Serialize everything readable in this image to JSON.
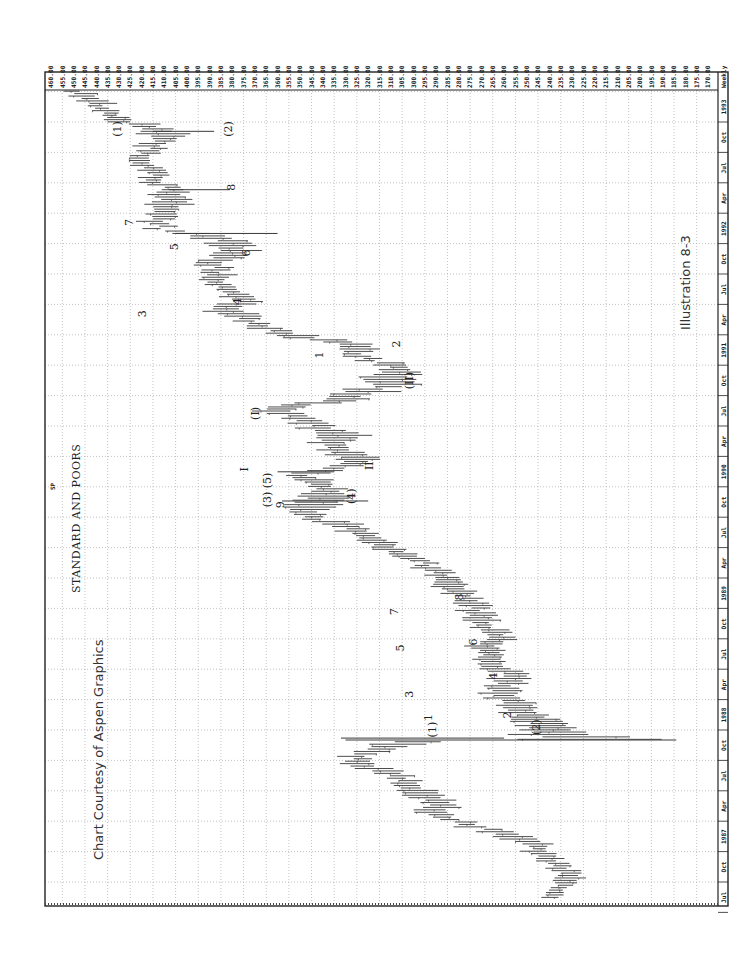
{
  "chart_data": {
    "type": "bar",
    "subtype": "weekly high-low price bars (OHLC range), rotated 90 degrees clockwise",
    "title": "STANDARD AND POORS",
    "symbol": "SP",
    "periodicity": "Weekly",
    "credit": "Chart Courtesy of Aspen Graphics",
    "illustration_label": "Illustration 8-3",
    "orientation": "price axis along top (high values at left), time axis along right side (newest at top)",
    "price_axis": {
      "ticks": [
        "460.00",
        "455.00",
        "450.00",
        "445.00",
        "440.00",
        "435.00",
        "430.00",
        "425.00",
        "420.00",
        "415.00",
        "410.00",
        "405.00",
        "400.00",
        "395.00",
        "390.00",
        "385.00",
        "380.00",
        "375.00",
        "370.00",
        "365.00",
        "360.00",
        "355.00",
        "350.00",
        "345.00",
        "340.00",
        "335.00",
        "330.00",
        "325.00",
        "320.00",
        "315.00",
        "310.00",
        "305.00",
        "300.00",
        "295.00",
        "290.00",
        "285.00",
        "280.00",
        "275.00",
        "270.00",
        "265.00",
        "260.00",
        "255.00",
        "250.00",
        "245.00",
        "240.00",
        "235.00",
        "230.00",
        "225.00",
        "220.00",
        "215.00",
        "210.00",
        "205.00",
        "200.00",
        "195.00",
        "190.00",
        "185.00",
        "180.00",
        "175.00",
        "170.00"
      ],
      "range": [
        170,
        460
      ],
      "grid_every": 10
    },
    "time_axis": {
      "ticks": [
        "Jul",
        "Oct",
        "1987",
        "Apr",
        "Jul",
        "Oct",
        "1988",
        "Apr",
        "Jul",
        "Oct",
        "1989",
        "Apr",
        "Jul",
        "Oct",
        "1990",
        "Apr",
        "Jul",
        "Oct",
        "1991",
        "Apr",
        "Jul",
        "Oct",
        "1992",
        "Apr",
        "Jul",
        "Oct",
        "1993"
      ],
      "range": [
        "1986-07",
        "1993-03"
      ],
      "grid": "quarterly"
    },
    "series": [
      {
        "name": "SP weekly range (approx. midpoint path)",
        "points": [
          {
            "t": 1986.5,
            "low": 236,
            "high": 246
          },
          {
            "t": 1986.6,
            "low": 226,
            "high": 240
          },
          {
            "t": 1986.7,
            "low": 226,
            "high": 240
          },
          {
            "t": 1986.8,
            "low": 232,
            "high": 246
          },
          {
            "t": 1986.92,
            "low": 240,
            "high": 252
          },
          {
            "t": 1987.0,
            "low": 246,
            "high": 266
          },
          {
            "t": 1987.1,
            "low": 270,
            "high": 285
          },
          {
            "t": 1987.2,
            "low": 285,
            "high": 302
          },
          {
            "t": 1987.3,
            "low": 280,
            "high": 300
          },
          {
            "t": 1987.4,
            "low": 290,
            "high": 308
          },
          {
            "t": 1987.5,
            "low": 300,
            "high": 315
          },
          {
            "t": 1987.6,
            "low": 315,
            "high": 335
          },
          {
            "t": 1987.66,
            "low": 318,
            "high": 334
          },
          {
            "t": 1987.74,
            "low": 300,
            "high": 322
          },
          {
            "t": 1987.78,
            "low": 285,
            "high": 315
          },
          {
            "t": 1987.8,
            "low": 185,
            "high": 260
          },
          {
            "t": 1987.86,
            "low": 225,
            "high": 255
          },
          {
            "t": 1987.93,
            "low": 230,
            "high": 255
          },
          {
            "t": 1988.0,
            "low": 240,
            "high": 262
          },
          {
            "t": 1988.08,
            "low": 245,
            "high": 265
          },
          {
            "t": 1988.16,
            "low": 250,
            "high": 270
          },
          {
            "t": 1988.26,
            "low": 250,
            "high": 273
          },
          {
            "t": 1988.34,
            "low": 250,
            "high": 268
          },
          {
            "t": 1988.44,
            "low": 260,
            "high": 275
          },
          {
            "t": 1988.55,
            "low": 260,
            "high": 275
          },
          {
            "t": 1988.62,
            "low": 255,
            "high": 270
          },
          {
            "t": 1988.7,
            "low": 260,
            "high": 273
          },
          {
            "t": 1988.78,
            "low": 265,
            "high": 282
          },
          {
            "t": 1988.88,
            "low": 262,
            "high": 280
          },
          {
            "t": 1989.0,
            "low": 270,
            "high": 285
          },
          {
            "t": 1989.15,
            "low": 280,
            "high": 300
          },
          {
            "t": 1989.25,
            "low": 290,
            "high": 300
          },
          {
            "t": 1989.4,
            "low": 305,
            "high": 322
          },
          {
            "t": 1989.55,
            "low": 320,
            "high": 340
          },
          {
            "t": 1989.65,
            "low": 340,
            "high": 355
          },
          {
            "t": 1989.75,
            "low": 330,
            "high": 360
          },
          {
            "t": 1989.8,
            "low": 320,
            "high": 350
          },
          {
            "t": 1989.88,
            "low": 330,
            "high": 345
          },
          {
            "t": 1989.97,
            "low": 340,
            "high": 360
          },
          {
            "t": 1990.05,
            "low": 320,
            "high": 340
          },
          {
            "t": 1990.12,
            "low": 315,
            "high": 335
          },
          {
            "t": 1990.22,
            "low": 330,
            "high": 345
          },
          {
            "t": 1990.3,
            "low": 320,
            "high": 345
          },
          {
            "t": 1990.4,
            "low": 335,
            "high": 355
          },
          {
            "t": 1990.5,
            "low": 350,
            "high": 368
          },
          {
            "t": 1990.55,
            "low": 345,
            "high": 362
          },
          {
            "t": 1990.6,
            "low": 315,
            "high": 345
          },
          {
            "t": 1990.7,
            "low": 300,
            "high": 325
          },
          {
            "t": 1990.8,
            "low": 295,
            "high": 320
          },
          {
            "t": 1990.86,
            "low": 298,
            "high": 315
          },
          {
            "t": 1990.95,
            "low": 318,
            "high": 332
          },
          {
            "t": 1991.05,
            "low": 310,
            "high": 335
          },
          {
            "t": 1991.12,
            "low": 340,
            "high": 365
          },
          {
            "t": 1991.22,
            "low": 365,
            "high": 380
          },
          {
            "t": 1991.32,
            "low": 370,
            "high": 390
          },
          {
            "t": 1991.42,
            "low": 365,
            "high": 385
          },
          {
            "t": 1991.52,
            "low": 375,
            "high": 390
          },
          {
            "t": 1991.62,
            "low": 380,
            "high": 395
          },
          {
            "t": 1991.72,
            "low": 380,
            "high": 395
          },
          {
            "t": 1991.82,
            "low": 370,
            "high": 390
          },
          {
            "t": 1991.92,
            "low": 375,
            "high": 400
          },
          {
            "t": 1992.0,
            "low": 405,
            "high": 420
          },
          {
            "t": 1992.1,
            "low": 405,
            "high": 418
          },
          {
            "t": 1992.22,
            "low": 395,
            "high": 420
          },
          {
            "t": 1992.3,
            "low": 400,
            "high": 415
          },
          {
            "t": 1992.4,
            "low": 405,
            "high": 420
          },
          {
            "t": 1992.5,
            "low": 410,
            "high": 425
          },
          {
            "t": 1992.6,
            "low": 415,
            "high": 428
          },
          {
            "t": 1992.7,
            "low": 405,
            "high": 420
          },
          {
            "t": 1992.78,
            "low": 395,
            "high": 420
          },
          {
            "t": 1992.86,
            "low": 415,
            "high": 430
          },
          {
            "t": 1992.95,
            "low": 430,
            "high": 442
          },
          {
            "t": 1993.05,
            "low": 435,
            "high": 450
          },
          {
            "t": 1993.15,
            "low": 440,
            "high": 455
          }
        ]
      }
    ],
    "annotations": [
      {
        "text": "(1)",
        "t": 1992.82,
        "price": 429
      },
      {
        "text": "(2)",
        "t": 1992.82,
        "price": 380
      },
      {
        "text": "8",
        "t": 1992.34,
        "price": 379
      },
      {
        "text": "7",
        "t": 1992.05,
        "price": 424
      },
      {
        "text": "5",
        "t": 1991.85,
        "price": 404
      },
      {
        "text": "6",
        "t": 1991.8,
        "price": 372
      },
      {
        "text": "3",
        "t": 1991.3,
        "price": 418
      },
      {
        "text": "4",
        "t": 1991.4,
        "price": 376
      },
      {
        "text": "1",
        "t": 1990.96,
        "price": 340
      },
      {
        "text": "2",
        "t": 1991.05,
        "price": 306
      },
      {
        "text": "(II)",
        "t": 1990.75,
        "price": 300
      },
      {
        "text": "(I)",
        "t": 1990.48,
        "price": 368
      },
      {
        "text": "II",
        "t": 1990.05,
        "price": 318
      },
      {
        "text": "I",
        "t": 1990.02,
        "price": 373
      },
      {
        "text": "(3) (5)",
        "t": 1989.85,
        "price": 363
      },
      {
        "text": "9",
        "t": 1989.73,
        "price": 357
      },
      {
        "text": "(4)",
        "t": 1989.8,
        "price": 326
      },
      {
        "text": "8",
        "t": 1988.97,
        "price": 278
      },
      {
        "text": "7",
        "t": 1988.85,
        "price": 307
      },
      {
        "text": "6",
        "t": 1988.6,
        "price": 272
      },
      {
        "text": "5",
        "t": 1988.55,
        "price": 304
      },
      {
        "text": "4",
        "t": 1988.32,
        "price": 263
      },
      {
        "text": "3",
        "t": 1988.17,
        "price": 300
      },
      {
        "text": "1",
        "t": 1987.98,
        "price": 292
      },
      {
        "text": "2",
        "t": 1988.0,
        "price": 257
      },
      {
        "text": "(1)",
        "t": 1987.88,
        "price": 290
      },
      {
        "text": "(2)",
        "t": 1987.9,
        "price": 244
      }
    ]
  },
  "colors": {
    "bars": "#3a3a3a",
    "grid": "#9a9a9a",
    "frame": "#222222",
    "text": "#222222",
    "background": "#ffffff"
  }
}
